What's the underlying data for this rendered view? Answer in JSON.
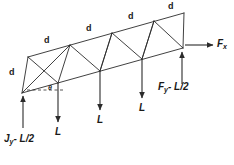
{
  "diagram": {
    "stroke_color": "#2b2b2b",
    "text_color": "#1a1a1a",
    "member_labels": {
      "top_chord": [
        "d",
        "d",
        "d",
        "d"
      ],
      "end_post": "d"
    },
    "angle_label": "θ",
    "loads": [
      {
        "name": "load-1",
        "label": "L",
        "direction": "down"
      },
      {
        "name": "load-2",
        "label": "L",
        "direction": "down"
      },
      {
        "name": "load-3",
        "label": "L",
        "direction": "down"
      }
    ],
    "reactions": [
      {
        "name": "left-support-reaction",
        "label": "J",
        "sub": "y",
        "suffix": "- L/2",
        "direction": "up"
      },
      {
        "name": "right-support-reaction",
        "label": "F",
        "sub": "y",
        "suffix": "- L/2",
        "direction": "up"
      },
      {
        "name": "horizontal-force",
        "label": "F",
        "sub": "x",
        "suffix": "",
        "direction": "right"
      }
    ],
    "geometry": {
      "top_chord": [
        [
          28,
          57
        ],
        [
          70,
          45
        ],
        [
          112,
          33
        ],
        [
          154,
          21
        ],
        [
          184,
          13
        ]
      ],
      "bottom_chord": [
        [
          22,
          93
        ],
        [
          58,
          83
        ],
        [
          100,
          71
        ],
        [
          142,
          59
        ],
        [
          183,
          48
        ]
      ],
      "diagonals": "warren-with-verticals"
    }
  }
}
